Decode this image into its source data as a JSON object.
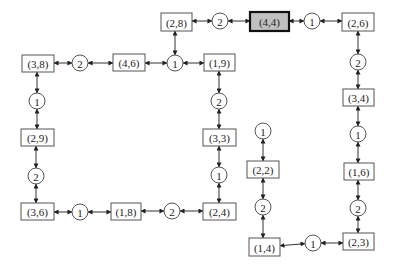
{
  "diagram": {
    "type": "graph",
    "boxes": [
      {
        "id": "b28",
        "label": "(2,8)",
        "x": 161,
        "y": 13,
        "w": 31,
        "h": 18
      },
      {
        "id": "b44",
        "label": "(4,4)",
        "x": 250,
        "y": 12,
        "w": 39,
        "h": 19,
        "highlight": true
      },
      {
        "id": "b26",
        "label": "(2,6)",
        "x": 342,
        "y": 13,
        "w": 32,
        "h": 18
      },
      {
        "id": "b38",
        "label": "(3,8)",
        "x": 22,
        "y": 55,
        "w": 32,
        "h": 17
      },
      {
        "id": "b46",
        "label": "(4,6)",
        "x": 113,
        "y": 54,
        "w": 32,
        "h": 17
      },
      {
        "id": "b19",
        "label": "(1,9)",
        "x": 204,
        "y": 54,
        "w": 31,
        "h": 17
      },
      {
        "id": "b34",
        "label": "(3,4)",
        "x": 343,
        "y": 89,
        "w": 31,
        "h": 17
      },
      {
        "id": "b29",
        "label": "(2,9)",
        "x": 21,
        "y": 129,
        "w": 33,
        "h": 17
      },
      {
        "id": "b33",
        "label": "(3,3)",
        "x": 203,
        "y": 129,
        "w": 33,
        "h": 17
      },
      {
        "id": "b22",
        "label": "(2,2)",
        "x": 247,
        "y": 161,
        "w": 32,
        "h": 17
      },
      {
        "id": "b16",
        "label": "(1,6)",
        "x": 344,
        "y": 163,
        "w": 30,
        "h": 17
      },
      {
        "id": "b36",
        "label": "(3,6)",
        "x": 21,
        "y": 203,
        "w": 33,
        "h": 17
      },
      {
        "id": "b18",
        "label": "(1,8)",
        "x": 111,
        "y": 203,
        "w": 30,
        "h": 17
      },
      {
        "id": "b24",
        "label": "(2,4)",
        "x": 203,
        "y": 203,
        "w": 33,
        "h": 17
      },
      {
        "id": "b14",
        "label": "(1,4)",
        "x": 249,
        "y": 238,
        "w": 31,
        "h": 18
      },
      {
        "id": "b23",
        "label": "(2,3)",
        "x": 343,
        "y": 233,
        "w": 31,
        "h": 17
      }
    ],
    "circles": [
      {
        "id": "c_top2",
        "label": "2",
        "cx": 220,
        "cy": 21,
        "r": 8
      },
      {
        "id": "c_top1",
        "label": "1",
        "cx": 312,
        "cy": 21,
        "r": 8
      },
      {
        "id": "c_l2",
        "label": "2",
        "cx": 80,
        "cy": 63,
        "r": 8
      },
      {
        "id": "c_m1",
        "label": "1",
        "cx": 175,
        "cy": 63,
        "r": 8
      },
      {
        "id": "c_r2a",
        "label": "2",
        "cx": 358,
        "cy": 62,
        "r": 8
      },
      {
        "id": "c_l1",
        "label": "1",
        "cx": 37,
        "cy": 101,
        "r": 8
      },
      {
        "id": "c_m2",
        "label": "2",
        "cx": 219,
        "cy": 101,
        "r": 8
      },
      {
        "id": "c_s1",
        "label": "1",
        "cx": 263,
        "cy": 131,
        "r": 8
      },
      {
        "id": "c_r1a",
        "label": "1",
        "cx": 358,
        "cy": 134,
        "r": 8
      },
      {
        "id": "c_l2b",
        "label": "2",
        "cx": 36,
        "cy": 176,
        "r": 8
      },
      {
        "id": "c_m1b",
        "label": "1",
        "cx": 219,
        "cy": 175,
        "r": 8
      },
      {
        "id": "c_s2",
        "label": "2",
        "cx": 263,
        "cy": 207,
        "r": 8
      },
      {
        "id": "c_r2b",
        "label": "2",
        "cx": 358,
        "cy": 208,
        "r": 8
      },
      {
        "id": "c_b1",
        "label": "1",
        "cx": 80,
        "cy": 212,
        "r": 8
      },
      {
        "id": "c_b2",
        "label": "2",
        "cx": 172,
        "cy": 211,
        "r": 8
      },
      {
        "id": "c_br1",
        "label": "1",
        "cx": 313,
        "cy": 243,
        "r": 8
      }
    ],
    "edges": [
      {
        "from": "b28",
        "to": "c_top2"
      },
      {
        "from": "c_top2",
        "to": "b44"
      },
      {
        "from": "b44",
        "to": "c_top1"
      },
      {
        "from": "c_top1",
        "to": "b26"
      },
      {
        "from": "b26",
        "to": "c_r2a"
      },
      {
        "from": "c_r2a",
        "to": "b34"
      },
      {
        "from": "b34",
        "to": "c_r1a"
      },
      {
        "from": "c_r1a",
        "to": "b16"
      },
      {
        "from": "b16",
        "to": "c_r2b"
      },
      {
        "from": "c_r2b",
        "to": "b23"
      },
      {
        "from": "b23",
        "to": "c_br1"
      },
      {
        "from": "c_br1",
        "to": "b14"
      },
      {
        "from": "b14",
        "to": "c_s2"
      },
      {
        "from": "c_s2",
        "to": "b22"
      },
      {
        "from": "b22",
        "to": "c_s1"
      },
      {
        "from": "b28",
        "to": "c_m1"
      },
      {
        "from": "c_m1",
        "to": "b46"
      },
      {
        "from": "c_m1",
        "to": "b19"
      },
      {
        "from": "b46",
        "to": "c_l2"
      },
      {
        "from": "c_l2",
        "to": "b38"
      },
      {
        "from": "b38",
        "to": "c_l1"
      },
      {
        "from": "c_l1",
        "to": "b29"
      },
      {
        "from": "b29",
        "to": "c_l2b"
      },
      {
        "from": "c_l2b",
        "to": "b36"
      },
      {
        "from": "b36",
        "to": "c_b1"
      },
      {
        "from": "c_b1",
        "to": "b18"
      },
      {
        "from": "b18",
        "to": "c_b2"
      },
      {
        "from": "c_b2",
        "to": "b24"
      },
      {
        "from": "b24",
        "to": "c_m1b"
      },
      {
        "from": "c_m1b",
        "to": "b33"
      },
      {
        "from": "b33",
        "to": "c_m2"
      },
      {
        "from": "c_m2",
        "to": "b19"
      }
    ]
  }
}
